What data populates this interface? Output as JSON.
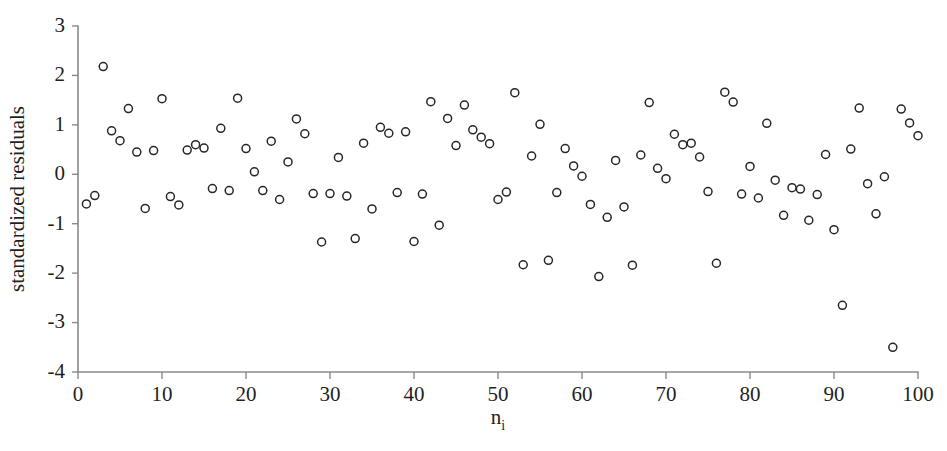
{
  "figure": {
    "background_color": "#ffffff",
    "marker_color": "#26262b",
    "axis_color": "#8a8a8a",
    "text_color": "#1f1f1f",
    "marker_style": "open-circle",
    "marker_radius": 4
  },
  "chart_data": {
    "type": "scatter",
    "title": "",
    "subtitle": "",
    "xlabel": "n",
    "xlabel_subscript": "i",
    "ylabel": "standardized residuals",
    "xlim": [
      0,
      100
    ],
    "ylim": [
      -4,
      3
    ],
    "xticks": [
      0,
      10,
      20,
      30,
      40,
      50,
      60,
      70,
      80,
      90,
      100
    ],
    "yticks": [
      3,
      2,
      1,
      0,
      -1,
      -2,
      -3,
      -4
    ],
    "xtick_labels": [
      "0",
      "10",
      "20",
      "30",
      "40",
      "50",
      "60",
      "70",
      "80",
      "90",
      "100"
    ],
    "ytick_labels": [
      "3",
      "2",
      "1",
      "0",
      "-1",
      "-2",
      "-3",
      "-4"
    ],
    "grid": false,
    "legend": false,
    "series": [
      {
        "name": "standardized residuals",
        "marker": "open-circle",
        "points": [
          [
            1,
            -0.6
          ],
          [
            2,
            -0.43
          ],
          [
            3,
            2.18
          ],
          [
            4,
            0.88
          ],
          [
            5,
            0.68
          ],
          [
            6,
            1.33
          ],
          [
            7,
            0.45
          ],
          [
            8,
            -0.69
          ],
          [
            9,
            0.48
          ],
          [
            10,
            1.53
          ],
          [
            11,
            -0.45
          ],
          [
            12,
            -0.62
          ],
          [
            13,
            0.49
          ],
          [
            14,
            0.6
          ],
          [
            15,
            0.53
          ],
          [
            16,
            -0.29
          ],
          [
            17,
            0.93
          ],
          [
            18,
            -0.33
          ],
          [
            19,
            1.54
          ],
          [
            20,
            0.52
          ],
          [
            21,
            0.05
          ],
          [
            22,
            -0.33
          ],
          [
            23,
            0.67
          ],
          [
            24,
            -0.51
          ],
          [
            25,
            0.25
          ],
          [
            26,
            1.12
          ],
          [
            27,
            0.82
          ],
          [
            28,
            -0.39
          ],
          [
            29,
            -1.37
          ],
          [
            30,
            -0.39
          ],
          [
            31,
            0.34
          ],
          [
            32,
            -0.44
          ],
          [
            33,
            -1.3
          ],
          [
            34,
            0.63
          ],
          [
            35,
            -0.7
          ],
          [
            36,
            0.95
          ],
          [
            37,
            0.83
          ],
          [
            38,
            -0.37
          ],
          [
            39,
            0.86
          ],
          [
            40,
            -1.36
          ],
          [
            41,
            -0.4
          ],
          [
            42,
            1.47
          ],
          [
            43,
            -1.03
          ],
          [
            44,
            1.13
          ],
          [
            45,
            0.58
          ],
          [
            46,
            1.4
          ],
          [
            47,
            0.9
          ],
          [
            48,
            0.75
          ],
          [
            49,
            0.62
          ],
          [
            50,
            -0.51
          ],
          [
            51,
            -0.36
          ],
          [
            52,
            1.65
          ],
          [
            53,
            -1.83
          ],
          [
            54,
            0.37
          ],
          [
            55,
            1.01
          ],
          [
            56,
            -1.74
          ],
          [
            57,
            -0.37
          ],
          [
            58,
            0.52
          ],
          [
            59,
            0.17
          ],
          [
            60,
            -0.04
          ],
          [
            61,
            -0.61
          ],
          [
            62,
            -2.07
          ],
          [
            63,
            -0.87
          ],
          [
            64,
            0.28
          ],
          [
            65,
            -0.66
          ],
          [
            66,
            -1.84
          ],
          [
            67,
            0.39
          ],
          [
            68,
            1.45
          ],
          [
            69,
            0.12
          ],
          [
            70,
            -0.09
          ],
          [
            71,
            0.81
          ],
          [
            72,
            0.6
          ],
          [
            73,
            0.63
          ],
          [
            74,
            0.35
          ],
          [
            75,
            -0.35
          ],
          [
            76,
            -1.8
          ],
          [
            77,
            1.66
          ],
          [
            78,
            1.46
          ],
          [
            79,
            -0.4
          ],
          [
            80,
            0.16
          ],
          [
            81,
            -0.48
          ],
          [
            82,
            1.03
          ],
          [
            83,
            -0.12
          ],
          [
            84,
            -0.83
          ],
          [
            85,
            -0.27
          ],
          [
            86,
            -0.3
          ],
          [
            87,
            -0.93
          ],
          [
            88,
            -0.41
          ],
          [
            89,
            0.4
          ],
          [
            90,
            -1.12
          ],
          [
            91,
            -2.65
          ],
          [
            92,
            0.51
          ],
          [
            93,
            1.34
          ],
          [
            94,
            -0.19
          ],
          [
            95,
            -0.8
          ],
          [
            96,
            -0.05
          ],
          [
            97,
            -3.5
          ],
          [
            98,
            1.32
          ],
          [
            99,
            1.04
          ],
          [
            100,
            0.78
          ]
        ]
      }
    ]
  }
}
